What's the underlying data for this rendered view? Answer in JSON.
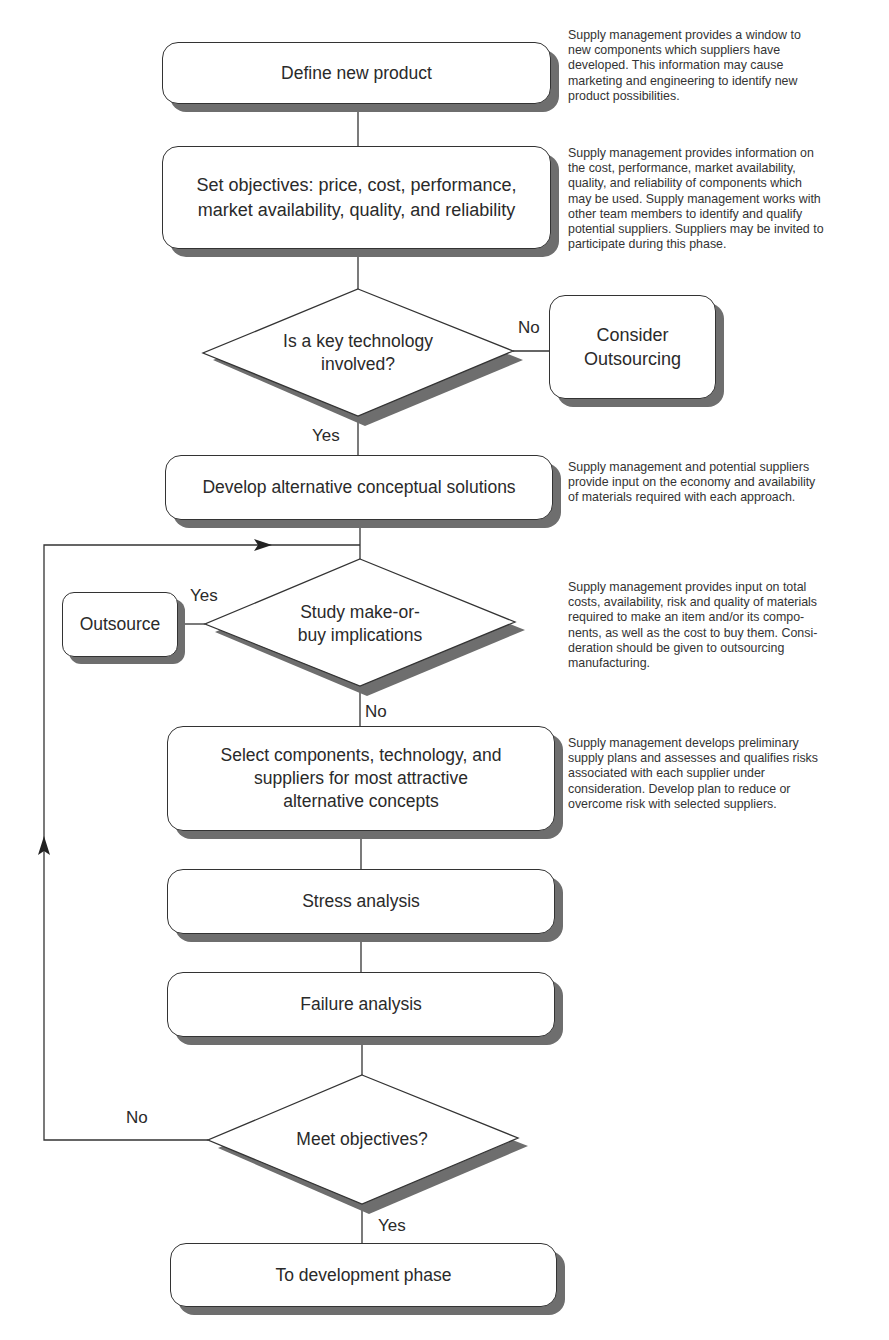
{
  "diagram": {
    "nodes": {
      "define_new_product": {
        "label": "Define new product",
        "type": "process"
      },
      "set_objectives": {
        "label": "Set objectives: price, cost, performance,\nmarket availability, quality, and reliability",
        "type": "process"
      },
      "key_technology": {
        "label": "Is a key technology\ninvolved?",
        "type": "decision"
      },
      "consider_outsourcing": {
        "label": "Consider\nOutsourcing",
        "type": "process"
      },
      "develop_alternatives": {
        "label": "Develop alternative conceptual solutions",
        "type": "process"
      },
      "make_or_buy": {
        "label": "Study make-or-\nbuy implications",
        "type": "decision"
      },
      "outsource": {
        "label": "Outsource",
        "type": "process"
      },
      "select_components": {
        "label": "Select components, technology, and\nsuppliers for most attractive\nalternative concepts",
        "type": "process"
      },
      "stress_analysis": {
        "label": "Stress analysis",
        "type": "process"
      },
      "failure_analysis": {
        "label": "Failure analysis",
        "type": "process"
      },
      "meet_objectives": {
        "label": "Meet objectives?",
        "type": "decision"
      },
      "to_development": {
        "label": "To development phase",
        "type": "process"
      }
    },
    "edge_labels": {
      "key_tech_no": "No",
      "key_tech_yes": "Yes",
      "make_buy_yes": "Yes",
      "make_buy_no": "No",
      "meet_obj_no": "No",
      "meet_obj_yes": "Yes"
    },
    "edges": [
      {
        "from": "define_new_product",
        "to": "set_objectives"
      },
      {
        "from": "set_objectives",
        "to": "key_technology"
      },
      {
        "from": "key_technology",
        "to": "consider_outsourcing",
        "label": "No"
      },
      {
        "from": "key_technology",
        "to": "develop_alternatives",
        "label": "Yes"
      },
      {
        "from": "develop_alternatives",
        "to": "make_or_buy"
      },
      {
        "from": "make_or_buy",
        "to": "outsource",
        "label": "Yes"
      },
      {
        "from": "make_or_buy",
        "to": "select_components",
        "label": "No"
      },
      {
        "from": "select_components",
        "to": "stress_analysis"
      },
      {
        "from": "stress_analysis",
        "to": "failure_analysis"
      },
      {
        "from": "failure_analysis",
        "to": "meet_objectives"
      },
      {
        "from": "meet_objectives",
        "to": "make_or_buy",
        "label": "No",
        "note": "feedback loop"
      },
      {
        "from": "meet_objectives",
        "to": "to_development",
        "label": "Yes"
      }
    ],
    "notes": {
      "define": "Supply management provides a window to\nnew components which suppliers have\ndeveloped.  This information may cause\nmarketing and engineering to identify new\nproduct possibilities.",
      "objectives": "Supply management provides information on\nthe cost, performance, market availability,\nquality, and reliability of components which\nmay be used.  Supply management works with\nother team members to identify and qualify\npotential suppliers. Suppliers may be invited to\nparticipate during this phase.",
      "develop": "Supply management and potential suppliers\nprovide input on the economy and availability\nof materials required with each approach.",
      "make_buy": "Supply management provides input on total\ncosts, availability, risk and quality of materials\nrequired to make an item and/or its compo-\nnents, as well as the cost to buy them.  Consi-\nderation should be given to outsourcing\nmanufacturing.",
      "select": "Supply management develops preliminary\nsupply plans and assesses and qualifies risks\nassociated with each supplier under\nconsideration. Develop plan to reduce or\novercome risk with selected suppliers."
    },
    "colors": {
      "line": "#333333",
      "shadow": "#6e6e6e",
      "fill": "#ffffff",
      "text": "#2a2a2a"
    }
  }
}
